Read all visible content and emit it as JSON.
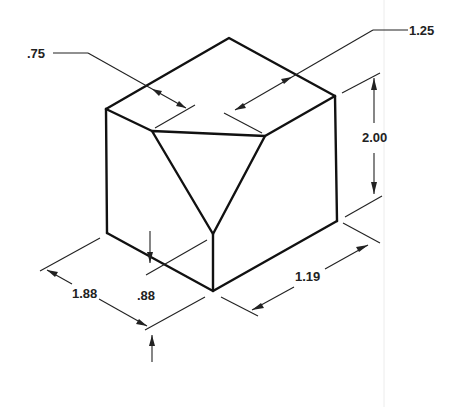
{
  "figure": {
    "type": "isometric-block-drawing"
  },
  "dimensions": {
    "chamfer_top_left": ".75",
    "chamfer_top_right": "1.25",
    "height": "2.00",
    "depth_left": "1.88",
    "chamfer_vertical": ".88",
    "width_right": "1.19"
  },
  "colors": {
    "line": "#111111",
    "background": "#ffffff"
  }
}
